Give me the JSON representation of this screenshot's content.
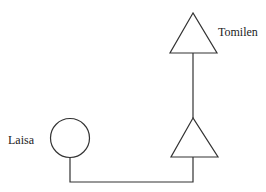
{
  "diagram": {
    "type": "kinship",
    "nodes": [
      {
        "id": "tomilen",
        "label": "Tomilen",
        "shape": "triangle"
      },
      {
        "id": "ego-male",
        "label": "",
        "shape": "triangle"
      },
      {
        "id": "laisa",
        "label": "Laisa",
        "shape": "circle"
      }
    ],
    "edges": [
      {
        "from": "tomilen",
        "to": "ego-male",
        "kind": "descent"
      },
      {
        "from": "ego-male",
        "to": "laisa",
        "kind": "marriage"
      }
    ]
  },
  "labels": {
    "tomilen": "Tomilen",
    "laisa": "Laisa"
  },
  "colors": {
    "stroke": "#333333",
    "background": "#ffffff"
  }
}
